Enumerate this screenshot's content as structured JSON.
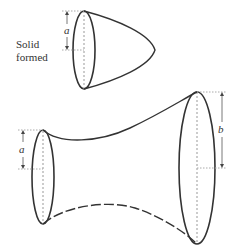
{
  "figure": {
    "caption_label": [
      "Solid",
      "formed"
    ],
    "top_solid": {
      "radius_label": "a",
      "shape": "paraboloid"
    },
    "bottom_solid": {
      "left_radius_label": "a",
      "right_radius_label": "b",
      "shape": "flared solid of revolution"
    },
    "colors": {
      "stroke": "#333333",
      "guide": "#999999"
    }
  }
}
